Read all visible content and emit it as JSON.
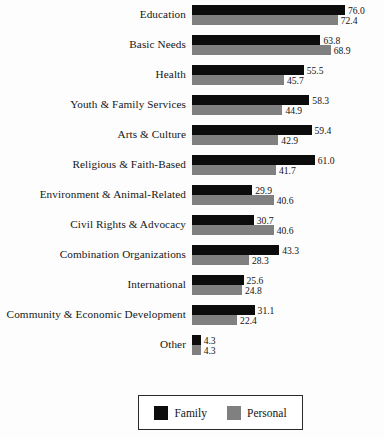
{
  "chart_data": {
    "type": "bar",
    "orientation": "horizontal",
    "title": "",
    "subtitle": "",
    "xlabel": "",
    "ylabel": "",
    "xlim": [
      0,
      80
    ],
    "grid": false,
    "legend_position": "bottom-center",
    "categories": [
      "Education",
      "Basic Needs",
      "Health",
      "Youth & Family Services",
      "Arts & Culture",
      "Religious & Faith-Based",
      "Environment & Animal-Related",
      "Civil Rights & Advocacy",
      "Combination Organizations",
      "International",
      "Community & Economic Development",
      "Other"
    ],
    "series": [
      {
        "name": "Family",
        "color": "#0c0c0c",
        "values": [
          76.0,
          63.8,
          55.5,
          58.3,
          59.4,
          61.0,
          29.9,
          30.7,
          43.3,
          25.6,
          31.1,
          4.3
        ],
        "labels": [
          "76.0",
          "63.8",
          "55.5",
          "58.3",
          "59.4",
          "61.0",
          "29.9",
          "30.7",
          "43.3",
          "25.6",
          "31.1",
          "4.3"
        ]
      },
      {
        "name": "Personal",
        "color": "#808080",
        "values": [
          72.4,
          68.9,
          45.7,
          44.9,
          42.9,
          41.7,
          40.6,
          40.6,
          28.3,
          24.8,
          22.4,
          4.3
        ],
        "labels": [
          "72.4",
          "68.9",
          "45.7",
          "44.9",
          "42.9",
          "41.7",
          "40.6",
          "40.6",
          "28.3",
          "24.8",
          "22.4",
          "4.3"
        ]
      }
    ]
  },
  "legend": {
    "entries": [
      {
        "label": "Family",
        "color": "#0c0c0c"
      },
      {
        "label": "Personal",
        "color": "#808080"
      }
    ]
  }
}
